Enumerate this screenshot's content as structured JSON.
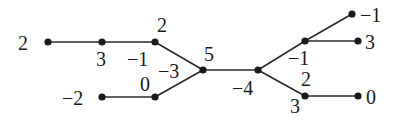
{
  "diagram": {
    "type": "tree",
    "nodes": [
      {
        "id": "A",
        "x": 48,
        "y": 42,
        "labels": [
          {
            "text": "2",
            "x": 18,
            "y": 50
          }
        ]
      },
      {
        "id": "B",
        "x": 102,
        "y": 42,
        "labels": [
          {
            "text": "3",
            "x": 96,
            "y": 66
          }
        ]
      },
      {
        "id": "C",
        "x": 155,
        "y": 42,
        "labels": [
          {
            "text": "2",
            "x": 157,
            "y": 32
          },
          {
            "text": "−1",
            "x": 127,
            "y": 66
          }
        ]
      },
      {
        "id": "D",
        "x": 203,
        "y": 70,
        "labels": [
          {
            "text": "5",
            "x": 204,
            "y": 61
          },
          {
            "text": "−3",
            "x": 158,
            "y": 78
          }
        ]
      },
      {
        "id": "E",
        "x": 102,
        "y": 97,
        "labels": [
          {
            "text": "−2",
            "x": 62,
            "y": 105
          }
        ]
      },
      {
        "id": "F",
        "x": 155,
        "y": 97,
        "labels": [
          {
            "text": "0",
            "x": 140,
            "y": 91
          }
        ]
      },
      {
        "id": "G",
        "x": 258,
        "y": 70,
        "labels": [
          {
            "text": "−4",
            "x": 232,
            "y": 95
          }
        ]
      },
      {
        "id": "H",
        "x": 305,
        "y": 41,
        "labels": [
          {
            "text": "−1",
            "x": 288,
            "y": 65
          }
        ]
      },
      {
        "id": "I",
        "x": 352,
        "y": 14,
        "labels": [
          {
            "text": "−1",
            "x": 360,
            "y": 22
          }
        ]
      },
      {
        "id": "J",
        "x": 358,
        "y": 41,
        "labels": [
          {
            "text": "3",
            "x": 365,
            "y": 49
          }
        ]
      },
      {
        "id": "K",
        "x": 305,
        "y": 96,
        "labels": [
          {
            "text": "2",
            "x": 301,
            "y": 86
          },
          {
            "text": "3",
            "x": 290,
            "y": 113
          }
        ]
      },
      {
        "id": "L",
        "x": 358,
        "y": 96,
        "labels": [
          {
            "text": "0",
            "x": 366,
            "y": 104
          }
        ]
      }
    ],
    "edges": [
      [
        "A",
        "B"
      ],
      [
        "B",
        "C"
      ],
      [
        "C",
        "D"
      ],
      [
        "E",
        "F"
      ],
      [
        "F",
        "D"
      ],
      [
        "D",
        "G"
      ],
      [
        "G",
        "H"
      ],
      [
        "H",
        "I"
      ],
      [
        "H",
        "J"
      ],
      [
        "G",
        "K"
      ],
      [
        "K",
        "L"
      ]
    ]
  }
}
